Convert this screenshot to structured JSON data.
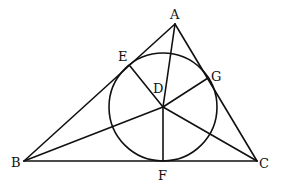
{
  "diagram": {
    "type": "geometry",
    "colors": {
      "stroke": "#111111",
      "background": "#ffffff"
    },
    "points": {
      "A": {
        "label": "A",
        "x": 175,
        "y": 24
      },
      "B": {
        "label": "B",
        "x": 24,
        "y": 161
      },
      "C": {
        "label": "C",
        "x": 257,
        "y": 161
      },
      "D": {
        "label": "D",
        "x": 163,
        "y": 107
      },
      "E": {
        "label": "E",
        "x": 130,
        "y": 66
      },
      "F": {
        "label": "F",
        "x": 163,
        "y": 161
      },
      "G": {
        "label": "G",
        "x": 208,
        "y": 78
      }
    },
    "circle": {
      "center": "D",
      "radius": 54
    },
    "segments": [
      [
        "A",
        "B"
      ],
      [
        "B",
        "C"
      ],
      [
        "C",
        "A"
      ],
      [
        "A",
        "D"
      ],
      [
        "B",
        "D"
      ],
      [
        "C",
        "D"
      ],
      [
        "D",
        "E"
      ],
      [
        "D",
        "F"
      ],
      [
        "D",
        "G"
      ]
    ],
    "labels": {
      "A": "A",
      "B": "B",
      "C": "C",
      "D": "D",
      "E": "E",
      "F": "F",
      "G": "G"
    }
  }
}
